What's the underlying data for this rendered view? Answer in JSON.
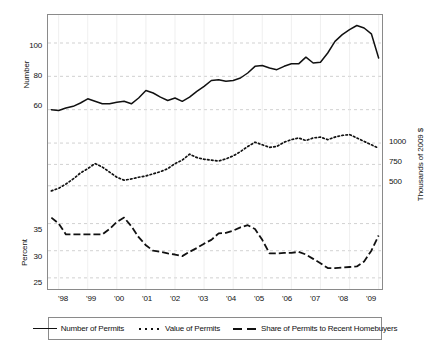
{
  "chart_data": {
    "type": "line",
    "title": "",
    "subtitle": "",
    "xlabel": "",
    "ylabel": "Number",
    "grid": true,
    "legend_position": "bottom",
    "panels": [
      {
        "name": "number-panel",
        "ylabel": "Number",
        "ytick_labels": [
          "100",
          "80",
          "60"
        ],
        "ytick_values": [
          100,
          80,
          60
        ],
        "ylim": [
          55,
          115
        ]
      },
      {
        "name": "value-panel",
        "ylabel": "Thousands of 2009 $",
        "ytick_labels": [
          "1000",
          "750",
          "500"
        ],
        "ytick_values": [
          1000,
          750,
          500
        ],
        "ylim": [
          380,
          1200
        ],
        "axis_side": "right"
      },
      {
        "name": "percent-panel",
        "ylabel": "Percent",
        "ytick_labels": [
          "35",
          "30",
          "25"
        ],
        "ytick_values": [
          35,
          30,
          25
        ],
        "ylim": [
          23.5,
          37.5
        ]
      }
    ],
    "xtick_labels": [
      "'98",
      "'99",
      "'00",
      "'01",
      "'02",
      "'03",
      "'04",
      "'05",
      "'06",
      "'07",
      "'08",
      "'09"
    ],
    "x": [
      1997.75,
      1998.0,
      1998.25,
      1998.5,
      1998.75,
      1999.0,
      1999.25,
      1999.5,
      1999.75,
      2000.0,
      2000.25,
      2000.5,
      2000.75,
      2001.0,
      2001.25,
      2001.5,
      2001.75,
      2002.0,
      2002.25,
      2002.5,
      2002.75,
      2003.0,
      2003.25,
      2003.5,
      2003.75,
      2004.0,
      2004.25,
      2004.5,
      2004.75,
      2005.0,
      2005.25,
      2005.5,
      2005.75,
      2006.0,
      2006.25,
      2006.5,
      2006.75,
      2007.0,
      2007.25,
      2007.5,
      2007.75,
      2008.0,
      2008.25,
      2008.5,
      2008.75,
      2009.0
    ],
    "series": [
      {
        "name": "Number of Permits",
        "style": "solid",
        "unit": "number",
        "panel": "number-panel",
        "color": "#111111",
        "values": [
          60,
          59.5,
          61,
          62,
          64,
          66.5,
          65,
          63.5,
          63.5,
          64.5,
          65,
          63.5,
          67,
          71.5,
          70,
          67.5,
          65.5,
          67,
          65,
          67.5,
          71,
          74,
          77.5,
          78,
          77,
          77.5,
          79,
          82,
          86,
          86.5,
          85,
          84,
          86,
          87.5,
          87.5,
          91.5,
          88,
          88.5,
          94,
          101,
          105,
          108,
          110.5,
          109,
          105.5,
          91
        ]
      },
      {
        "name": "Value of Permits",
        "style": "dotted",
        "unit": "thousands_2009_dollars",
        "panel": "value-panel",
        "color": "#111111",
        "values": [
          440,
          470,
          520,
          580,
          650,
          700,
          760,
          720,
          660,
          600,
          565,
          580,
          600,
          615,
          640,
          665,
          700,
          760,
          800,
          870,
          830,
          810,
          800,
          790,
          815,
          850,
          900,
          960,
          1010,
          980,
          950,
          960,
          1010,
          1040,
          1060,
          1030,
          1060,
          1070,
          1040,
          1070,
          1090,
          1100,
          1060,
          1020,
          980,
          940
        ]
      },
      {
        "name": "Share of Permits to Recent Homebuyers",
        "style": "dashed",
        "unit": "percent",
        "panel": "percent-panel",
        "color": "#111111",
        "values": [
          36.1,
          35.0,
          33.0,
          33.0,
          33.0,
          33.0,
          33.0,
          33.0,
          34.0,
          35.3,
          36.1,
          34.5,
          32.5,
          31.0,
          30.0,
          29.8,
          29.5,
          29.3,
          29.0,
          29.8,
          30.5,
          31.3,
          32.0,
          33.2,
          33.3,
          33.7,
          34.3,
          34.7,
          34.0,
          32.0,
          29.5,
          29.5,
          29.6,
          29.6,
          29.8,
          29.3,
          28.5,
          27.7,
          26.8,
          26.8,
          26.9,
          27.0,
          27.1,
          28.0,
          30.0,
          32.8
        ]
      }
    ]
  },
  "axes": {
    "left_top_title": "Number",
    "left_bottom_title": "Percent",
    "right_title": "Thousands of 2009 $",
    "left_top_ticks": [
      "100",
      "80",
      "60"
    ],
    "right_ticks": [
      "1000",
      "750",
      "500"
    ],
    "left_bottom_ticks": [
      "35",
      "30",
      "25"
    ],
    "xticks": [
      "'98",
      "'99",
      "'00",
      "'01",
      "'02",
      "'03",
      "'04",
      "'05",
      "'06",
      "'07",
      "'08",
      "'09"
    ]
  },
  "legend": {
    "items": [
      {
        "label": "Number of Permits",
        "style": "solid"
      },
      {
        "label": "Value of Permits",
        "style": "dotted"
      },
      {
        "label": "Share of Permits to Recent Homebuyers",
        "style": "dashed"
      }
    ]
  },
  "colors": {
    "line": "#111111",
    "grid": "#bdbdbd",
    "frame": "#8a8a8a",
    "background": "#ffffff"
  }
}
